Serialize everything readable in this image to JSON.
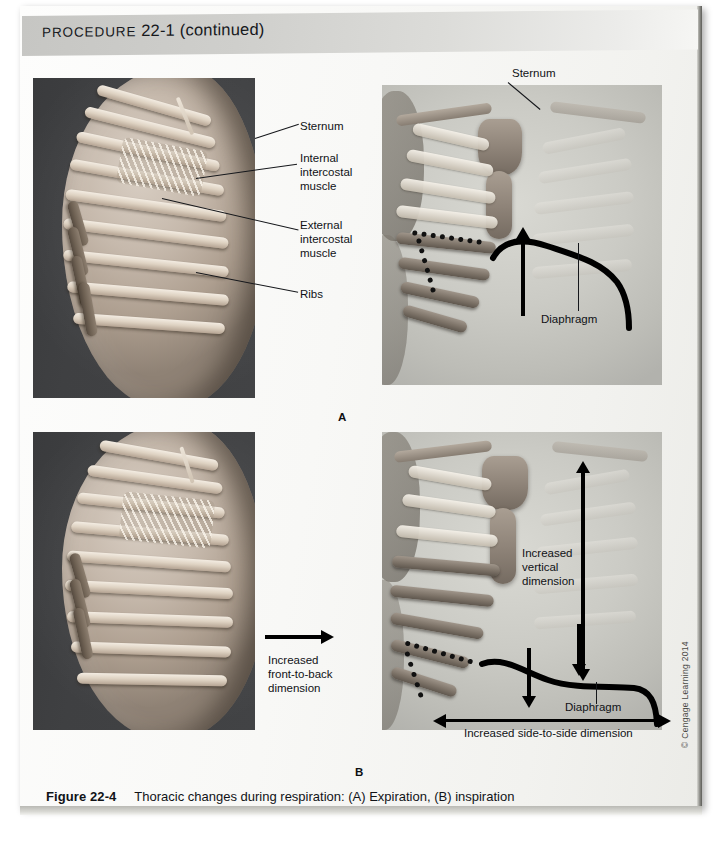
{
  "header": {
    "label_smallcaps": "PROCEDURE",
    "number": "22-1",
    "continued": "(continued)"
  },
  "panels": [
    {
      "letter": "A",
      "labels": {
        "sternum": "Sternum",
        "internal_intercostal": "Internal\nintercostal\nmuscle",
        "internal_intercostal_lines": [
          "Internal",
          "intercostal",
          "muscle"
        ],
        "external_intercostal_lines": [
          "External",
          "intercostal",
          "muscle"
        ],
        "ribs": "Ribs",
        "sternum_right": "Sternum",
        "diaphragm": "Diaphragm"
      }
    },
    {
      "letter": "B",
      "labels": {
        "front_to_back_lines": [
          "Increased",
          "front-to-back",
          "dimension"
        ],
        "vertical_lines": [
          "Increased",
          "vertical",
          "dimension"
        ],
        "diaphragm": "Diaphragm",
        "side_to_side": "Increased side-to-side dimension"
      }
    }
  ],
  "caption": {
    "figure_number": "Figure 22-4",
    "text": "Thoracic changes during respiration: (A) Expiration, (B) inspiration"
  },
  "copyright": "© Cengage Learning 2014",
  "colors": {
    "header_band": "#cfcfcc",
    "page": "#f8f8f6",
    "ink": "#14161a",
    "annotation": "#000000"
  }
}
